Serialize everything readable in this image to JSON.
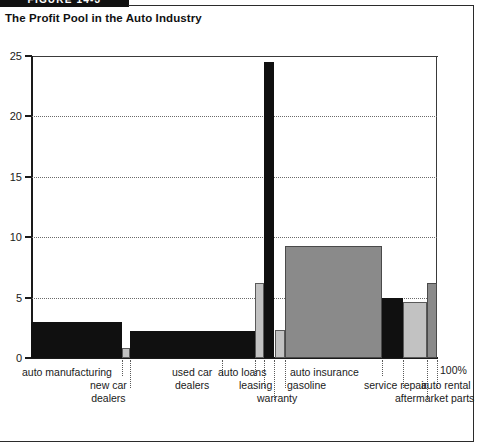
{
  "figure": {
    "tab_label": "FIGURE 14-3"
  },
  "title": "The Profit Pool in the Auto Industry",
  "axis": {
    "y_ticks": [
      "0",
      "5",
      "10",
      "15",
      "20",
      "25"
    ],
    "hundred_percent_label": "100%"
  },
  "labels": {
    "auto_manufacturing": "auto manufacturing",
    "new_car_dealers_l1": "new car",
    "new_car_dealers_l2": "dealers",
    "used_car_dealers_l1": "used car",
    "used_car_dealers_l2": "dealers",
    "auto_loans": "auto loans",
    "leasing": "leasing",
    "warranty": "warranty",
    "gasoline": "gasoline",
    "auto_insurance": "auto insurance",
    "service_repair": "service repair",
    "aftermarket_parts": "aftermarket parts",
    "auto_rental": "auto rental"
  },
  "chart_data": {
    "type": "bar",
    "title": "The Profit Pool in the Auto Industry",
    "xlabel": "",
    "ylabel": "",
    "ylim": [
      0,
      25
    ],
    "yticks": [
      0,
      5,
      10,
      15,
      20,
      25
    ],
    "grid": true,
    "legend": "none",
    "note": "Marimekko-style profit pool chart: bar width represents share of industry revenue (x axis runs 0 to 100%), bar height represents operating margin / profit pool percentage.",
    "categories": [
      "auto manufacturing",
      "new car dealers",
      "used car dealers",
      "auto loans",
      "leasing",
      "warranty",
      "gasoline",
      "auto insurance",
      "service repair",
      "aftermarket parts",
      "auto rental"
    ],
    "values": [
      3.0,
      0.8,
      2.2,
      2.2,
      6.2,
      24.5,
      2.3,
      9.3,
      5.0,
      4.6,
      6.2
    ],
    "x_start_pct": [
      0.0,
      22.4,
      24.4,
      47.0,
      55.2,
      57.4,
      60.1,
      62.6,
      86.5,
      91.6,
      97.5
    ],
    "x_end_pct": [
      22.4,
      24.4,
      47.0,
      55.2,
      57.4,
      59.8,
      62.6,
      86.5,
      91.6,
      97.5,
      100.0
    ],
    "colors": [
      "#101010",
      "#c2c2c2",
      "#101010",
      "#101010",
      "#c2c2c2",
      "#101010",
      "#c2c2c2",
      "#8a8a8a",
      "#101010",
      "#c2c2c2",
      "#8a8a8a"
    ]
  }
}
